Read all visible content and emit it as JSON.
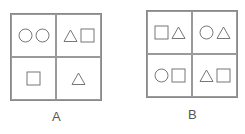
{
  "figures": [
    {
      "label": "A",
      "cells": [
        [
          "circle",
          "circle"
        ],
        [
          "triangle",
          "square"
        ],
        [
          "square"
        ],
        [
          "triangle"
        ]
      ]
    },
    {
      "label": "B",
      "cells": [
        [
          "square",
          "triangle"
        ],
        [
          "circle",
          "triangle"
        ],
        [
          "circle",
          "square"
        ],
        [
          "triangle",
          "square"
        ]
      ]
    }
  ],
  "colors": {
    "stroke": "#777777",
    "border": "#8a8a8a"
  }
}
